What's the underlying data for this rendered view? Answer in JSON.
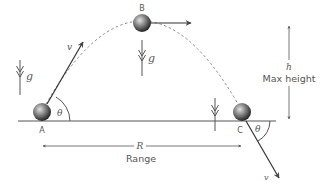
{
  "diagram": {
    "colors": {
      "line": "#555555",
      "dashed": "#888888",
      "ball_light": "#d8d8d8",
      "ball_dark": "#2a2a2a",
      "text": "#555555"
    },
    "points": {
      "A": {
        "label": "A"
      },
      "B": {
        "label": "B"
      },
      "C": {
        "label": "C"
      }
    },
    "labels": {
      "velocity_launch": "v",
      "velocity_impact": "v",
      "angle_launch": "θ",
      "angle_impact": "θ",
      "gravity_left": "g",
      "gravity_top": "g",
      "range_symbol": "R",
      "range_text": "Range",
      "height_symbol": "h",
      "height_text": "Max height"
    }
  }
}
